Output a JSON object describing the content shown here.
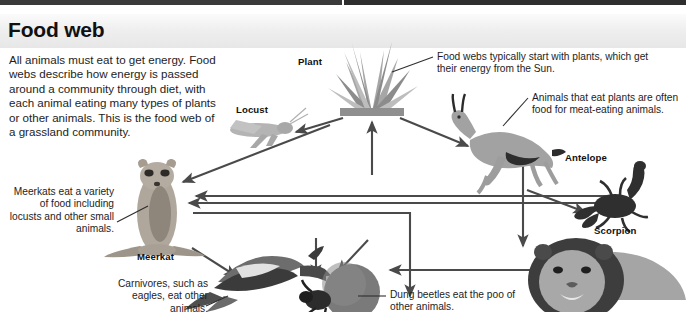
{
  "header": {
    "title": "Food web"
  },
  "intro": {
    "text": "All animals must eat to get energy. Food webs describe how energy is passed around a community through diet, with each animal eating many types of plants or other animals. This is the food web of a grassland community."
  },
  "species": [
    {
      "key": "plant",
      "label": "Plant",
      "icon": "grass-tuft-icon"
    },
    {
      "key": "locust",
      "label": "Locust",
      "icon": "locust-icon"
    },
    {
      "key": "meerkat",
      "label": "Meerkat",
      "icon": "meerkat-icon"
    },
    {
      "key": "antelope",
      "label": "Antelope",
      "icon": "antelope-icon"
    },
    {
      "key": "scorpion",
      "label": "Scorpion",
      "icon": "scorpion-icon"
    },
    {
      "key": "eagle",
      "label": "",
      "icon": "eagle-icon"
    },
    {
      "key": "dungbeetle",
      "label": "",
      "icon": "dung-beetle-icon"
    },
    {
      "key": "lion",
      "label": "",
      "icon": "lion-icon"
    }
  ],
  "labels": {
    "plant": "Plant",
    "locust": "Locust",
    "meerkat": "Meerkat",
    "antelope": "Antelope",
    "scorpion": "Scorpion"
  },
  "notes": {
    "plant": "Food webs typically start with plants, which get their energy from the Sun.",
    "antelope": "Animals that eat plants are often food for meat-eating animals.",
    "meerkat": "Meerkats eat a variety of food including locusts and other small animals.",
    "eagle": "Carnivores, such as eagles, eat other animals.",
    "dungbeetle": "Dung beetles eat the poo of other animals."
  },
  "colors": {
    "background": "#ffffff",
    "header_band": "#ececec",
    "text": "#1d1d1d",
    "arrow": "#4a4a4a",
    "plant_green": "#9a9a9a",
    "top_strip": "#3a3a3a"
  },
  "arrows": [
    {
      "from": "plant",
      "to": "locust"
    },
    {
      "from": "plant",
      "to": "antelope"
    },
    {
      "from": "plant",
      "to": "meerkat"
    },
    {
      "from": "locust",
      "to": "meerkat"
    },
    {
      "from": "antelope",
      "to": "lion"
    },
    {
      "from": "scorpion",
      "to": "meerkat"
    },
    {
      "from": "meerkat",
      "to": "eagle"
    },
    {
      "from": "antelope",
      "to": "scorpion"
    },
    {
      "from": "lion",
      "to": "dungbeetle"
    },
    {
      "from": "eagle",
      "to": "dungbeetle"
    },
    {
      "from": "meerkat",
      "to": "dungbeetle"
    },
    {
      "from": "dungbeetle",
      "to": "plant"
    }
  ]
}
